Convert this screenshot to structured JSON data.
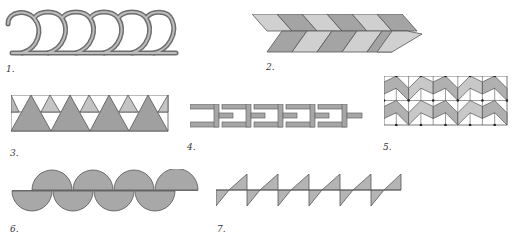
{
  "figures": [
    {
      "id": 1,
      "label": "1.",
      "name": "interlocking loops border"
    },
    {
      "id": 2,
      "label": "2.",
      "name": "herringbone chevron band"
    },
    {
      "id": 3,
      "label": "3.",
      "name": "triangle band"
    },
    {
      "id": 4,
      "label": "4.",
      "name": "interlocking bracket chain"
    },
    {
      "id": 5,
      "label": "5.",
      "name": "zigzag grid tessellation"
    },
    {
      "id": 6,
      "label": "6.",
      "name": "alternating semicircles band"
    },
    {
      "id": 7,
      "label": "7.",
      "name": "sawtooth triangles band"
    }
  ],
  "colors": {
    "fill_dark": "#9e9e9e",
    "fill_mid": "#b4b4b4",
    "fill_light": "#d0d0d0",
    "stroke": "#555555",
    "background": "#ffffff"
  }
}
